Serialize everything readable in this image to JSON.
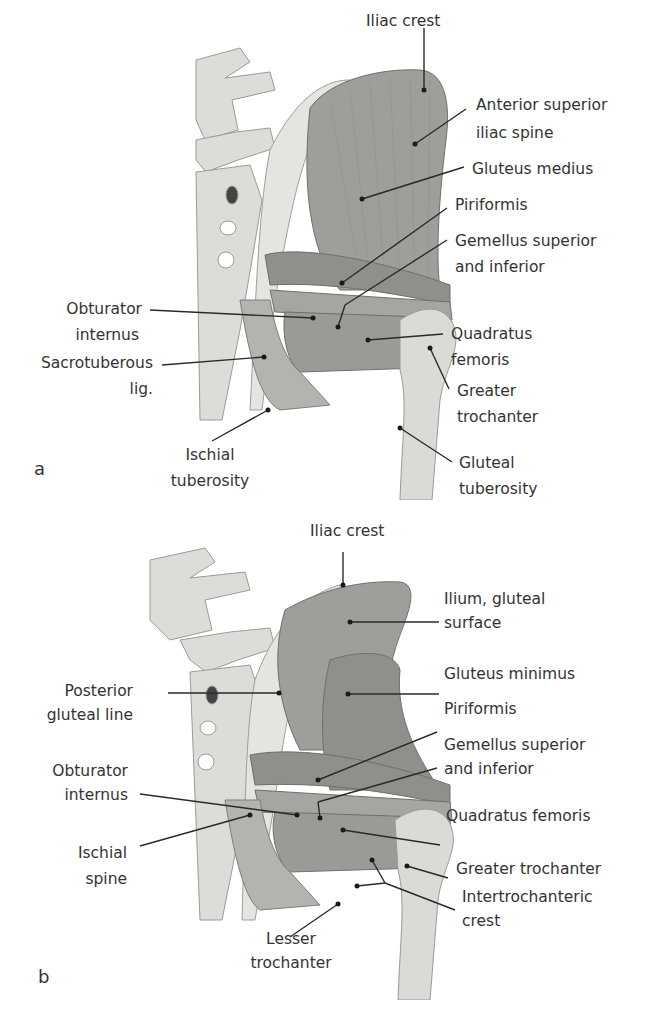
{
  "figure": {
    "panels": [
      {
        "letter": "a",
        "labels": {
          "iliac_crest": "Iliac crest",
          "asis_1": "Anterior superior",
          "asis_2": "iliac spine",
          "gluteus_medius": "Gluteus medius",
          "piriformis": "Piriformis",
          "gemellus_1": "Gemellus superior",
          "gemellus_2": "and inferior",
          "obturator_1": "Obturator",
          "obturator_2": "internus",
          "sacrotuberous_1": "Sacrotuberous",
          "sacrotuberous_2": "lig.",
          "quadratus_1": "Quadratus",
          "quadratus_2": "femoris",
          "greater_troch_1": "Greater",
          "greater_troch_2": "trochanter",
          "ischial_tub_1": "Ischial",
          "ischial_tub_2": "tuberosity",
          "gluteal_tub_1": "Gluteal",
          "gluteal_tub_2": "tuberosity"
        }
      },
      {
        "letter": "b",
        "labels": {
          "iliac_crest": "Iliac crest",
          "ilium_1": "Ilium, gluteal",
          "ilium_2": "surface",
          "posterior_1": "Posterior",
          "posterior_2": "gluteal line",
          "gluteus_minimus": "Gluteus minimus",
          "piriformis": "Piriformis",
          "obturator_1": "Obturator",
          "obturator_2": "internus",
          "gemellus_1": "Gemellus superior",
          "gemellus_2": "and inferior",
          "quadratus": "Quadratus femoris",
          "ischial_spine_1": "Ischial",
          "ischial_spine_2": "spine",
          "greater_troch": "Greater trochanter",
          "intertroch_1": "Intertrochanteric",
          "intertroch_2": "crest",
          "lesser_troch_1": "Lesser",
          "lesser_troch_2": "trochanter"
        }
      }
    ],
    "colors": {
      "bone": "#d9d9d6",
      "bone_dark": "#a9a9a6",
      "muscle": "#9b9b98",
      "muscle_dark": "#7e7e7b",
      "leader": "#2a2a2a",
      "background": "#ffffff"
    }
  }
}
